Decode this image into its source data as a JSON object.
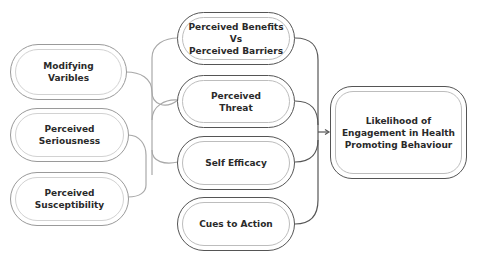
{
  "diagram": {
    "left_column": [
      {
        "id": "modifying",
        "label": "Modifying\nVaribles"
      },
      {
        "id": "seriousness",
        "label": "Perceived\nSeriousness"
      },
      {
        "id": "susceptibility",
        "label": "Perceived\nSusceptibility"
      }
    ],
    "middle_column": [
      {
        "id": "benefits",
        "label": "Perceived Benefits\nVs\nPerceived Barriers"
      },
      {
        "id": "threat",
        "label": "Perceived\nThreat"
      },
      {
        "id": "efficacy",
        "label": "Self Efficacy"
      },
      {
        "id": "cues",
        "label": "Cues to Action"
      }
    ],
    "outcome": {
      "id": "outcome",
      "label": "Likelihood of\nEngagement in Health\nPromoting Behaviour"
    },
    "edges": [
      {
        "from": "modifying",
        "to": "benefits"
      },
      {
        "from": "modifying",
        "to": "threat"
      },
      {
        "from": "modifying",
        "to": "efficacy"
      },
      {
        "from": "seriousness",
        "to": "threat"
      },
      {
        "from": "susceptibility",
        "to": "threat"
      },
      {
        "from": "benefits",
        "to": "outcome"
      },
      {
        "from": "threat",
        "to": "outcome"
      },
      {
        "from": "efficacy",
        "to": "outcome"
      },
      {
        "from": "cues",
        "to": "outcome"
      }
    ],
    "colors": {
      "dark_line": "#555555",
      "light_line": "#a8a8a8",
      "text": "#2a2a2a"
    }
  }
}
